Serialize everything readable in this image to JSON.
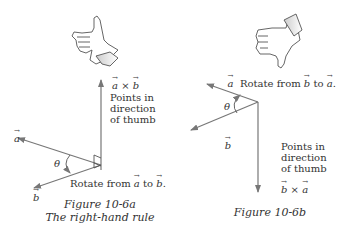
{
  "figure_a": {
    "caption_line1": "Figure 10-6a",
    "caption_line2": "The right-hand rule",
    "hand": "thumbs-up",
    "vector_a": "a",
    "vector_b": "b",
    "cross_product_v1": "a",
    "cross_product_op": "×",
    "cross_product_v2": "b",
    "note_lines": [
      "Points in",
      "direction",
      "of thumb"
    ],
    "rotate_text": "Rotate from",
    "rotate_from": "a",
    "rotate_to_word": "to",
    "rotate_to": "b",
    "angle_label": "θ"
  },
  "figure_b": {
    "caption_line1": "Figure 10-6b",
    "hand": "thumbs-down",
    "vector_a": "a",
    "vector_b": "b",
    "cross_product_v1": "b",
    "cross_product_op": "×",
    "cross_product_v2": "a",
    "note_lines": [
      "Points in",
      "direction",
      "of thumb"
    ],
    "rotate_text": "Rotate from",
    "rotate_from": "b",
    "rotate_to_word": "to",
    "rotate_to": "a",
    "angle_label": "θ"
  },
  "colors": {
    "vector_line": "#777777",
    "text": "#333333",
    "hand_outline": "#555555"
  }
}
